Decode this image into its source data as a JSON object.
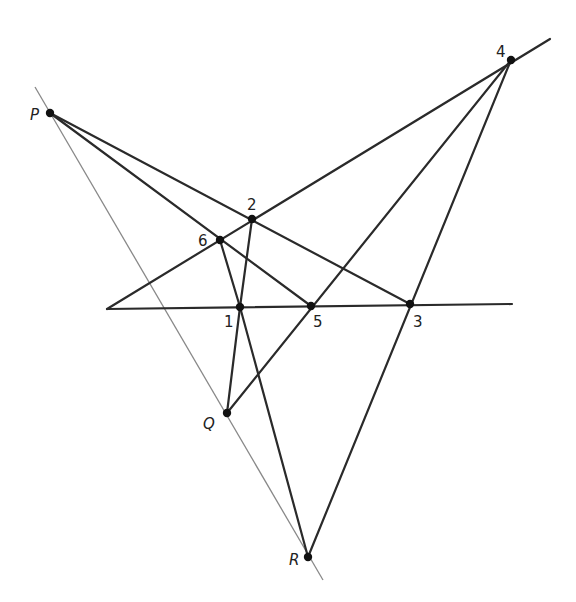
{
  "diagram": {
    "type": "projective-geometry-construction",
    "colors": {
      "line": "#2a2a2a",
      "thin_line": "#888888",
      "point": "#111111",
      "background": "#ffffff"
    },
    "points": {
      "P": {
        "label": "P",
        "x": 50,
        "y": 113,
        "italic": true
      },
      "Q": {
        "label": "Q",
        "x": 227,
        "y": 413,
        "italic": true
      },
      "R": {
        "label": "R",
        "x": 308,
        "y": 557,
        "italic": true
      },
      "p1": {
        "label": "1",
        "x": 240,
        "y": 307
      },
      "p2": {
        "label": "2",
        "x": 252,
        "y": 219
      },
      "p3": {
        "label": "3",
        "x": 410,
        "y": 304
      },
      "p4": {
        "label": "4",
        "x": 511,
        "y": 60
      },
      "p5": {
        "label": "5",
        "x": 311,
        "y": 306
      },
      "p6": {
        "label": "6",
        "x": 220,
        "y": 240
      }
    },
    "labels": [
      {
        "id": "P",
        "text": "P",
        "x": 30,
        "y": 120,
        "italic": true
      },
      {
        "id": "Q",
        "text": "Q",
        "x": 203,
        "y": 429,
        "italic": true
      },
      {
        "id": "R",
        "text": "R",
        "x": 289,
        "y": 565,
        "italic": true
      },
      {
        "id": "p1",
        "text": "1",
        "x": 224,
        "y": 327
      },
      {
        "id": "p2",
        "text": "2",
        "x": 247,
        "y": 210
      },
      {
        "id": "p3",
        "text": "3",
        "x": 413,
        "y": 327
      },
      {
        "id": "p4",
        "text": "4",
        "x": 496,
        "y": 57
      },
      {
        "id": "p5",
        "text": "5",
        "x": 313,
        "y": 327
      },
      {
        "id": "p6",
        "text": "6",
        "x": 198,
        "y": 246
      }
    ],
    "thin_lines": [
      {
        "name": "line-PQR",
        "x1": 35,
        "y1": 87,
        "x2": 323,
        "y2": 580
      }
    ],
    "lines": [
      {
        "name": "line-horizontal-135",
        "x1": 107,
        "y1": 309,
        "x2": 512,
        "y2": 304
      },
      {
        "name": "line-62-4",
        "x1": 107,
        "y1": 309,
        "x2": 550,
        "y2": 39
      },
      {
        "name": "line-P-2-3",
        "x1": 50,
        "y1": 113,
        "x2": 410,
        "y2": 304
      },
      {
        "name": "line-P-6-5",
        "x1": 50,
        "y1": 113,
        "x2": 311,
        "y2": 306
      },
      {
        "name": "line-6-1",
        "x1": 220,
        "y1": 240,
        "x2": 240,
        "y2": 307
      },
      {
        "name": "line-2-1",
        "x1": 252,
        "y1": 219,
        "x2": 240,
        "y2": 307
      },
      {
        "name": "line-1-Q",
        "x1": 240,
        "y1": 307,
        "x2": 227,
        "y2": 413
      },
      {
        "name": "line-1-R",
        "x1": 240,
        "y1": 307,
        "x2": 308,
        "y2": 557
      },
      {
        "name": "line-Q-5-4",
        "x1": 227,
        "y1": 413,
        "x2": 511,
        "y2": 60
      },
      {
        "name": "line-R-3-4",
        "x1": 308,
        "y1": 557,
        "x2": 511,
        "y2": 60
      }
    ]
  }
}
